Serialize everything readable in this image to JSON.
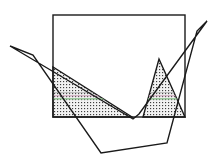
{
  "figure": {
    "canvas": {
      "width": 217,
      "height": 165,
      "background": "#ffffff"
    },
    "colors": {
      "stroke": "#1a1a1a",
      "fill": "#ffffff",
      "hatch": "#4a4a4a",
      "hatch_background": "#f0f0f0",
      "hatch_accent_green": "#8fbf8f",
      "hatch_accent_pink": "#c89ab4",
      "scan_line": "#c9c9c9"
    },
    "stroke_width": 1.4,
    "shapes": [
      {
        "name": "rectangle",
        "type": "rect",
        "x": 53,
        "y": 15,
        "width": 132,
        "height": 102,
        "fill": "none",
        "stroke": "#1a1a1a"
      },
      {
        "name": "boat-polygon",
        "type": "polygon",
        "points": "10,46 133,119 139,114 207,21 197,31 167,143 101,153 33,55",
        "fill": "none",
        "stroke": "#1a1a1a"
      },
      {
        "name": "left-hatched-triangle",
        "type": "polygon",
        "points": "53,67 53,117 132,117",
        "fill": "hatch",
        "stroke": "#1a1a1a"
      },
      {
        "name": "right-hatched-triangle",
        "type": "polygon",
        "points": "159,59 185,117 143,117",
        "fill": "hatch",
        "stroke": "#1a1a1a"
      }
    ],
    "vertices": {
      "rect_top_left": [
        53,
        15
      ],
      "rect_top_right": [
        185,
        15
      ],
      "rect_bottom_right": [
        185,
        117
      ],
      "rect_bottom_left": [
        53,
        117
      ],
      "left_apex": [
        10,
        46
      ],
      "right_apex": [
        207,
        21
      ],
      "v_bottom": [
        133,
        119
      ],
      "v_bottom_notch": [
        139,
        114
      ],
      "boat_bottom_left": [
        101,
        153
      ],
      "boat_bottom_right": [
        167,
        143
      ]
    },
    "scan_artifact": {
      "name": "scan-line",
      "x": 6,
      "y": 2,
      "width": 205,
      "height": 1
    }
  }
}
